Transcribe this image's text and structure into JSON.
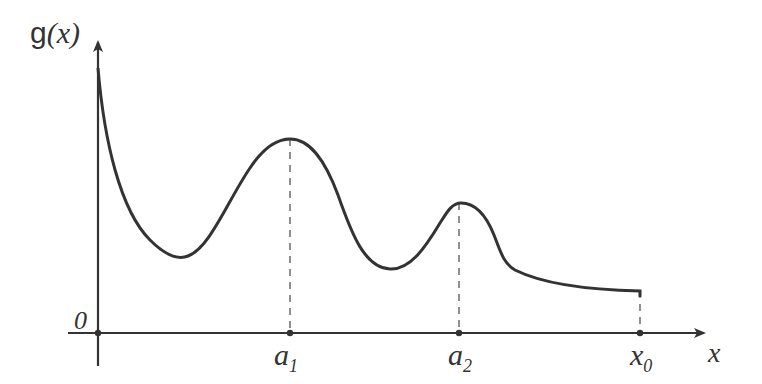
{
  "diagram": {
    "y_axis_label": {
      "func": "g",
      "arg": "(x)"
    },
    "x_axis_label": "x",
    "origin_label": "0",
    "points": [
      {
        "name": "a",
        "sub": "1",
        "x_px": 290
      },
      {
        "name": "a",
        "sub": "2",
        "x_px": 459
      },
      {
        "name": "x",
        "sub": "0",
        "x_px": 640
      }
    ],
    "curve_description": "Function g(x) decreasing from high value at origin, local minimum, local maximum at a1, local minimum, smaller local maximum at a2, then decreasing toward asymptote ending at x0",
    "colors": {
      "line": "#333333",
      "background": "#ffffff"
    }
  }
}
